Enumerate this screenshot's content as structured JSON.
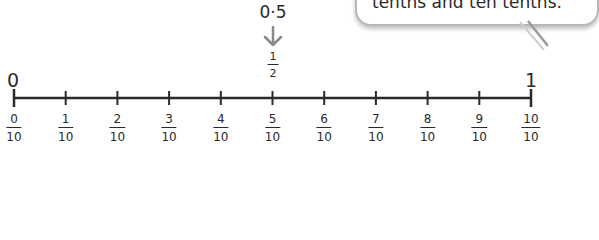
{
  "speech_bubble": {
    "text": "tenths and ten tenths."
  },
  "marker": {
    "decimal_label": "0·5",
    "arrow_icon": "down-arrow",
    "fraction": {
      "numerator": "1",
      "denominator": "2"
    }
  },
  "number_line": {
    "start_label": "0",
    "end_label": "1",
    "ticks": [
      {
        "numerator": "0",
        "denominator": "10"
      },
      {
        "numerator": "1",
        "denominator": "10"
      },
      {
        "numerator": "2",
        "denominator": "10"
      },
      {
        "numerator": "3",
        "denominator": "10"
      },
      {
        "numerator": "4",
        "denominator": "10"
      },
      {
        "numerator": "5",
        "denominator": "10"
      },
      {
        "numerator": "6",
        "denominator": "10"
      },
      {
        "numerator": "7",
        "denominator": "10"
      },
      {
        "numerator": "8",
        "denominator": "10"
      },
      {
        "numerator": "9",
        "denominator": "10"
      },
      {
        "numerator": "10",
        "denominator": "10"
      }
    ]
  },
  "colors": {
    "line": "#2a2a2a",
    "arrow": "#8a8a8a",
    "bubble_border": "#b8b8b8"
  }
}
